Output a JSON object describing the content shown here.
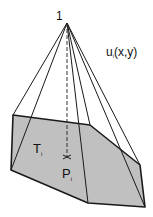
{
  "diagram": {
    "apex_label": "1",
    "function_label": {
      "main": "u",
      "sub": "i",
      "args": "(x,y)"
    },
    "triangle_label": {
      "main": "T",
      "sub": "i"
    },
    "point_label": {
      "main": "P",
      "sub": "i"
    },
    "colors": {
      "fill": "#c0c0c0",
      "stroke": "#1a1a1a"
    }
  }
}
